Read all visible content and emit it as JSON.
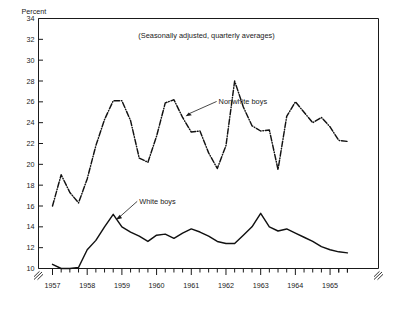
{
  "chart_data": {
    "type": "line",
    "title": "",
    "subtitle": "(Seasonally adjusted, quarterly averages)",
    "ylabel": "Percent",
    "xlabel": "",
    "ylim": [
      10,
      34
    ],
    "ytick_step": 2,
    "grid": false,
    "legend_position": "inline-annotations",
    "axis_break_y_below": 10,
    "axis_break_note": "zigzag break symbol on both vertical axes below the 10 tick",
    "yticks": [
      10,
      12,
      14,
      16,
      18,
      20,
      22,
      24,
      26,
      28,
      30,
      32,
      34
    ],
    "ytick_labels": [
      "10",
      "12",
      "14",
      "16",
      "18",
      "20",
      "22",
      "24",
      "26",
      "28",
      "30",
      "32",
      "34"
    ],
    "xticks": [
      1957,
      1958,
      1959,
      1960,
      1961,
      1962,
      1963,
      1964,
      1965
    ],
    "xtick_labels": [
      "1957",
      "1958",
      "1959",
      "1960",
      "1961",
      "1962",
      "1963",
      "1964",
      "1965"
    ],
    "minor_xticks_per_year": 4,
    "x": [
      "1957Q1",
      "1957Q2",
      "1957Q3",
      "1957Q4",
      "1958Q1",
      "1958Q2",
      "1958Q3",
      "1958Q4",
      "1959Q1",
      "1959Q2",
      "1959Q3",
      "1959Q4",
      "1960Q1",
      "1960Q2",
      "1960Q3",
      "1960Q4",
      "1961Q1",
      "1961Q2",
      "1961Q3",
      "1961Q4",
      "1962Q1",
      "1962Q2",
      "1962Q3",
      "1962Q4",
      "1963Q1",
      "1963Q2",
      "1963Q3",
      "1963Q4",
      "1964Q1",
      "1964Q2",
      "1964Q3",
      "1964Q4",
      "1965Q1",
      "1965Q2",
      "1965Q3"
    ],
    "series": [
      {
        "name": "Nonwhite boys",
        "style": "dash-dot",
        "values": [
          16.0,
          19.0,
          17.3,
          16.3,
          18.6,
          21.8,
          24.3,
          26.1,
          26.1,
          24.2,
          20.6,
          20.2,
          22.7,
          25.9,
          26.2,
          24.5,
          23.1,
          23.2,
          21.1,
          19.6,
          21.8,
          28.0,
          25.5,
          23.7,
          23.2,
          23.3,
          19.5,
          24.6,
          26.0,
          25.0,
          24.0,
          24.5,
          23.6,
          22.3,
          22.2
        ]
      },
      {
        "name": "White boys",
        "style": "solid",
        "values": [
          10.4,
          10.0,
          10.0,
          10.1,
          11.8,
          12.7,
          14.0,
          15.2,
          14.0,
          13.5,
          13.1,
          12.6,
          13.2,
          13.3,
          12.9,
          13.4,
          13.8,
          13.5,
          13.1,
          12.6,
          12.4,
          12.4,
          13.2,
          14.0,
          15.3,
          14.0,
          13.6,
          13.8,
          13.4,
          13.0,
          12.6,
          12.1,
          11.8,
          11.6,
          11.5
        ]
      }
    ],
    "annotations": [
      {
        "text": "Nonwhite boys",
        "target_series": "Nonwhite boys"
      },
      {
        "text": "White boys",
        "target_series": "White boys"
      }
    ]
  }
}
